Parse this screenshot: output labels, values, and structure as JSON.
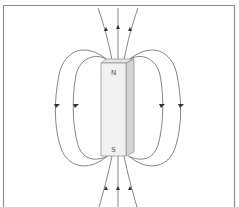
{
  "diagram": {
    "magnet": {
      "north_label": "N",
      "south_label": "S",
      "face_color": "#f1f1f1",
      "side_color": "#d4d4d4",
      "top_color": "#e6e6e6",
      "edge_color": "#8a8a8a"
    },
    "field_line_color": "#555555",
    "frame_color": "#8c8c8c",
    "arrows": {
      "top_direction": "up",
      "bottom_direction": "up",
      "side_direction": "down"
    }
  }
}
